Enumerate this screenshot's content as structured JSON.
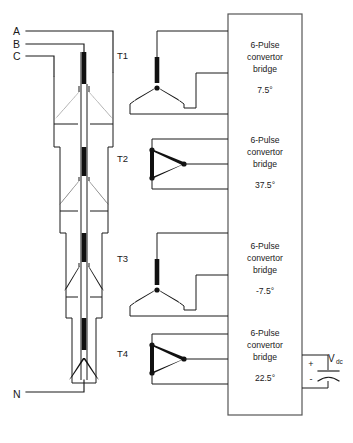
{
  "diagram": {
    "line_color": "#1a1a1a",
    "box_color": "#555555"
  },
  "supply_terminals": [
    {
      "id": "term-a",
      "label": "A"
    },
    {
      "id": "term-b",
      "label": "B"
    },
    {
      "id": "term-c",
      "label": "C"
    },
    {
      "id": "term-n",
      "label": "N"
    }
  ],
  "transformers": [
    {
      "id": "t1",
      "label": "T1",
      "winding": "wye"
    },
    {
      "id": "t2",
      "label": "T2",
      "winding": "delta"
    },
    {
      "id": "t3",
      "label": "T3",
      "winding": "wye"
    },
    {
      "id": "t4",
      "label": "T4",
      "winding": "delta"
    }
  ],
  "bridges": [
    {
      "id": "bridge-1",
      "line1": "6-Pulse",
      "line2": "convertor",
      "line3": "bridge",
      "angle": "7.5°"
    },
    {
      "id": "bridge-2",
      "line1": "6-Pulse",
      "line2": "convertor",
      "line3": "bridge",
      "angle": "37.5°"
    },
    {
      "id": "bridge-3",
      "line1": "6-Pulse",
      "line2": "convertor",
      "line3": "bridge",
      "angle": "-7.5°"
    },
    {
      "id": "bridge-4",
      "line1": "6-Pulse",
      "line2": "convertor",
      "line3": "bridge",
      "angle": "22.5°"
    }
  ],
  "output": {
    "plus_sign": "+",
    "minus_sign": "-",
    "voltage_label": "V",
    "voltage_subscript": "dc"
  }
}
